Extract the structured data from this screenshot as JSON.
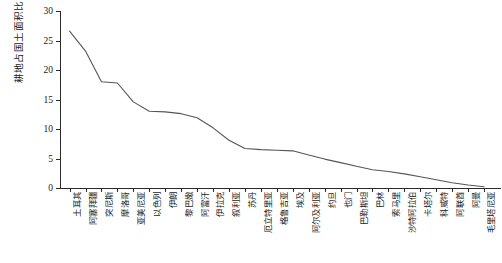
{
  "chart_data": {
    "type": "line",
    "title": "",
    "xlabel": "",
    "ylabel": "耕地占国土面积比例/%",
    "ylim": [
      0,
      30
    ],
    "yticks": [
      0,
      5,
      10,
      15,
      20,
      25,
      30
    ],
    "grid": false,
    "legend": null,
    "categories": [
      "土耳其",
      "阿塞拜疆",
      "突尼斯",
      "摩洛哥",
      "亚美尼亚",
      "以色列",
      "伊朗",
      "黎巴嫩",
      "阿富汗",
      "伊拉克",
      "叙利亚",
      "苏丹",
      "厄立特里亚",
      "格鲁吉亚",
      "埃及",
      "阿尔及利亚",
      "约旦",
      "也门",
      "巴勒斯坦",
      "巴林",
      "索马里",
      "沙特阿拉伯",
      "卡塔尔",
      "科威特",
      "阿联酋",
      "阿曼",
      "毛里塔尼亚"
    ],
    "values": [
      26.6,
      23.2,
      18.0,
      17.8,
      14.6,
      13.0,
      12.9,
      12.6,
      11.9,
      10.2,
      8.1,
      6.7,
      6.5,
      6.4,
      6.3,
      5.6,
      4.9,
      4.3,
      3.7,
      3.1,
      2.8,
      2.4,
      1.9,
      1.4,
      0.9,
      0.5,
      0.2
    ],
    "series_color": "#555555",
    "axis_color": "#2b2b2b"
  }
}
